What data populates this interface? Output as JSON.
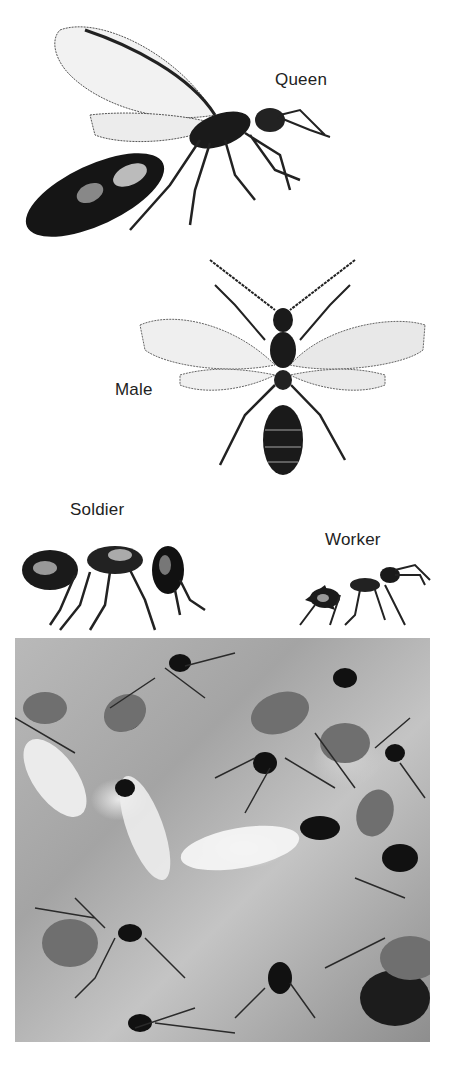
{
  "figure": {
    "castes": [
      {
        "id": "queen",
        "label": "Queen"
      },
      {
        "id": "male",
        "label": "Male"
      },
      {
        "id": "soldier",
        "label": "Soldier"
      },
      {
        "id": "worker",
        "label": "Worker"
      }
    ],
    "photo": {
      "description": "Black-and-white photograph of a colony of ants including winged reproductives and workers on a textured surface"
    }
  },
  "colors": {
    "ink": "#111111",
    "paper": "#ffffff",
    "photo_mid": "#a8a8a8"
  }
}
